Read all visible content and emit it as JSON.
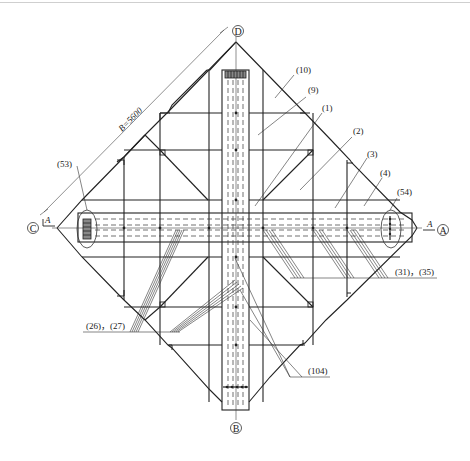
{
  "drawing": {
    "type": "foundation-plan",
    "dimension": {
      "label": "B=5600"
    },
    "axes": [
      {
        "id": "D",
        "label": "D",
        "position": "top"
      },
      {
        "id": "C",
        "label": "C",
        "position": "left"
      },
      {
        "id": "A",
        "label": "A",
        "position": "right"
      },
      {
        "id": "B",
        "label": "B",
        "position": "bottom"
      }
    ],
    "section_marks": [
      {
        "label": "A",
        "position": "left"
      },
      {
        "label": "A",
        "position": "right"
      }
    ],
    "callouts": [
      {
        "label": "(10)"
      },
      {
        "label": "(9)"
      },
      {
        "label": "(1)"
      },
      {
        "label": "(2)"
      },
      {
        "label": "(3)"
      },
      {
        "label": "(4)"
      },
      {
        "label": "(54)"
      },
      {
        "label": "(53)"
      },
      {
        "label": "(31)，(35)"
      },
      {
        "label": "(26)，(27)"
      },
      {
        "label": "(104)"
      }
    ]
  }
}
